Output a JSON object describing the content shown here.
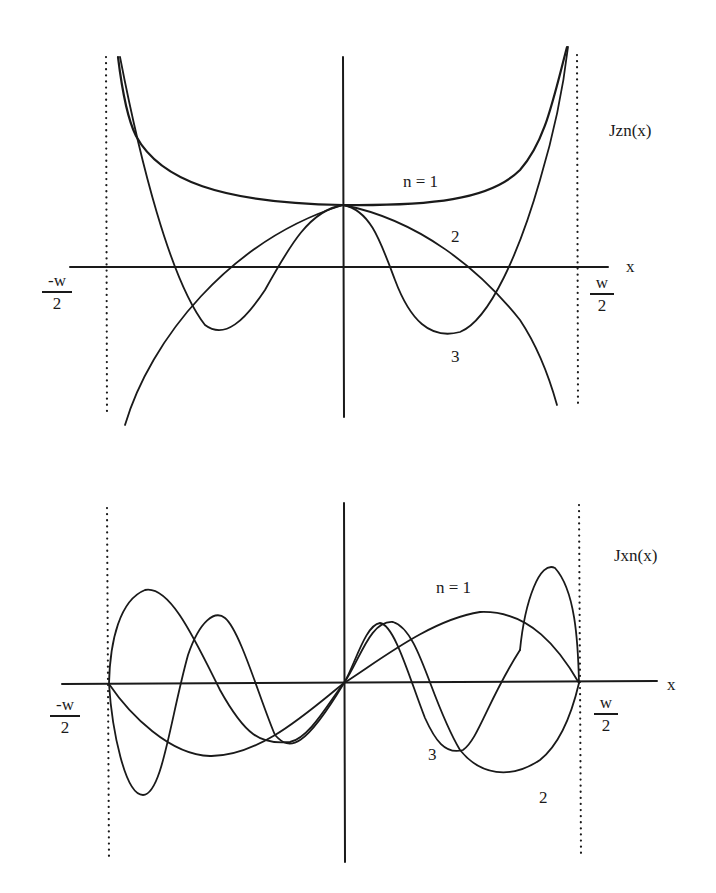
{
  "top": {
    "function_label": "Jzn(x)",
    "x_axis_label": "x",
    "left_bound": {
      "num": "-w",
      "den": "2"
    },
    "right_bound": {
      "num": "w",
      "den": "2"
    },
    "curve_labels": {
      "n1": "n = 1",
      "n2": "2",
      "n3": "3"
    }
  },
  "bottom": {
    "function_label": "Jxn(x)",
    "x_axis_label": "x",
    "left_bound": {
      "num": "-w",
      "den": "2"
    },
    "right_bound": {
      "num": "w",
      "den": "2"
    },
    "curve_labels": {
      "n1": "n = 1",
      "n2": "2",
      "n3": "3"
    }
  },
  "colors": {
    "ink": "#1a1a1a",
    "background": "#ffffff"
  }
}
